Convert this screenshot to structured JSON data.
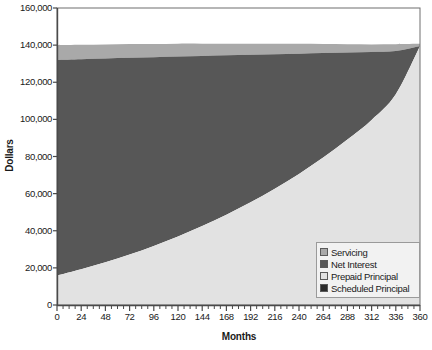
{
  "chart_data": {
    "type": "area",
    "stacked": true,
    "title": "",
    "xlabel": "Months",
    "ylabel": "Dollars",
    "xlim": [
      0,
      360
    ],
    "ylim": [
      0,
      160000
    ],
    "grid": false,
    "legend_position": "bottom-right",
    "x_ticks": [
      0,
      24,
      48,
      72,
      96,
      120,
      144,
      168,
      192,
      216,
      240,
      264,
      288,
      312,
      336,
      360
    ],
    "x_tick_labels": [
      "0",
      "24",
      "48",
      "72",
      "96",
      "120",
      "144",
      "168",
      "192",
      "216",
      "240",
      "264",
      "288",
      "312",
      "336",
      "360"
    ],
    "x_minor_tick_interval": 6,
    "y_ticks": [
      0,
      20000,
      40000,
      60000,
      80000,
      100000,
      120000,
      140000,
      160000
    ],
    "y_tick_labels": [
      "0",
      "20,000",
      "40,000",
      "60,000",
      "80,000",
      "100,000",
      "120,000",
      "140,000",
      "160,000"
    ],
    "x": [
      0,
      24,
      48,
      72,
      96,
      120,
      144,
      168,
      192,
      216,
      240,
      264,
      288,
      312,
      336,
      360
    ],
    "series": [
      {
        "name": "Scheduled Principal",
        "color": "#2b2b2b",
        "values": [
          0,
          0,
          0,
          0,
          0,
          0,
          0,
          0,
          0,
          0,
          0,
          0,
          0,
          0,
          0,
          0
        ]
      },
      {
        "name": "Prepaid Principal",
        "color": "#e2e2e2",
        "values": [
          15800,
          19200,
          23000,
          27200,
          31800,
          36900,
          42500,
          48600,
          55300,
          62600,
          70600,
          79400,
          89100,
          99700,
          113500,
          139500
        ]
      },
      {
        "name": "Net Interest",
        "color": "#575757",
        "values": [
          116200,
          113200,
          109800,
          106000,
          101700,
          97000,
          91700,
          85900,
          79500,
          72500,
          64800,
          56300,
          46900,
          36600,
          23300,
          0
        ]
      },
      {
        "name": "Servicing",
        "color": "#a9a9a9",
        "values": [
          8000,
          7800,
          7600,
          7400,
          7100,
          6900,
          6600,
          6300,
          6000,
          5700,
          5300,
          4900,
          4500,
          4100,
          3700,
          1200
        ]
      }
    ],
    "cumulative_top": [
      140000,
      140200,
      140400,
      140600,
      140600,
      140800,
      140800,
      140800,
      140800,
      140800,
      140700,
      140600,
      140500,
      140400,
      140500,
      140700
    ],
    "colors": {
      "servicing": "#a9a9a9",
      "net_interest": "#575757",
      "prepaid_principal": "#e2e2e2",
      "scheduled_principal": "#2b2b2b",
      "plot_background": "#ffffff",
      "axis": "#4a4a4a",
      "legend_background": "#f2f2f2",
      "legend_border": "#9a9a9a"
    }
  },
  "legend": {
    "items": [
      {
        "label": "Servicing"
      },
      {
        "label": "Net Interest"
      },
      {
        "label": "Prepaid Principal"
      },
      {
        "label": "Scheduled Principal"
      }
    ]
  }
}
